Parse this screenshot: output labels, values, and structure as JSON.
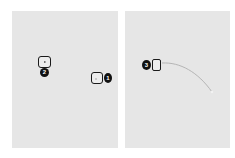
{
  "panels": [
    {
      "id": "left",
      "markers": [
        {
          "number": "1",
          "badge_label": "1",
          "box_icon": "empty-square-icon"
        },
        {
          "number": "2",
          "badge_label": "2",
          "box_icon": "play-triangle-icon"
        }
      ]
    },
    {
      "id": "right",
      "markers": [
        {
          "number": "3",
          "badge_label": "3",
          "box_icon": "empty-rectangle-icon"
        }
      ],
      "gesture_path": "curved-swipe"
    }
  ],
  "colors": {
    "page_background": "#ffffff",
    "panel_background": "#e6e6e6",
    "badge_fill": "#111111",
    "badge_text": "#ffffff",
    "box_border": "#1a1a1a",
    "curve_stroke": "#b5b5b5"
  }
}
